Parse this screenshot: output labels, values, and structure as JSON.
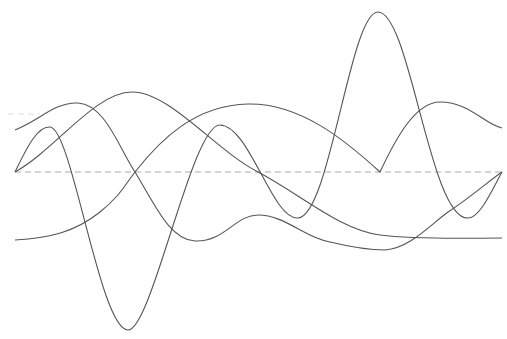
{
  "diagram": {
    "type": "overlapping-waveforms",
    "width": 507,
    "height": 339,
    "line_color": "#555555",
    "baseline": {
      "y": 172,
      "x1": 15,
      "x2": 502,
      "style": "dashed",
      "color": "#aaaaaa"
    },
    "faint_guide": {
      "y": 114,
      "x1": 8,
      "x2": 40,
      "style": "dashed",
      "color": "#dddddd"
    },
    "crossing_points_x": [
      15,
      135,
      258,
      380,
      502
    ],
    "curves": [
      {
        "name": "wave-a",
        "d": "M15,172 C28,145 38,126 50,127 C72,128 100,330 128,330 C152,330 192,124 220,125 C250,126 272,220 298,218 C330,216 350,12 378,12 C410,12 430,220 468,218 C480,218 492,190 502,172"
      },
      {
        "name": "wave-b",
        "d": "M15,130 C40,120 55,102 78,103 C105,104 120,150 135,172 C155,205 170,240 195,241 C225,242 235,215 258,215 C285,215 305,238 330,242 C355,248 372,250 385,250 C410,248 430,225 448,212 C470,198 490,180 502,172"
      },
      {
        "name": "wave-c",
        "d": "M15,172 C55,150 95,92 132,92 C170,92 215,150 258,172 C300,194 340,230 380,235 C420,240 470,238 502,238"
      },
      {
        "name": "wave-d",
        "d": "M15,240 C50,238 75,232 100,212 C120,196 125,185 135,172 C160,140 195,105 248,104 C300,103 345,140 380,172 C395,140 415,102 440,102 C470,102 485,125 502,128"
      }
    ]
  }
}
